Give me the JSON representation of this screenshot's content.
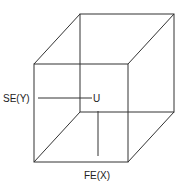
{
  "diagram": {
    "type": "cube",
    "stroke_color": "#333333",
    "labels": {
      "center": "U",
      "left": "SE(Y)",
      "bottom": "FE(X)"
    },
    "front_face": [
      [
        34,
        64
      ],
      [
        128,
        64
      ],
      [
        128,
        162
      ],
      [
        34,
        162
      ]
    ],
    "back_face": [
      [
        80,
        14
      ],
      [
        174,
        14
      ],
      [
        174,
        112
      ],
      [
        80,
        112
      ]
    ]
  }
}
